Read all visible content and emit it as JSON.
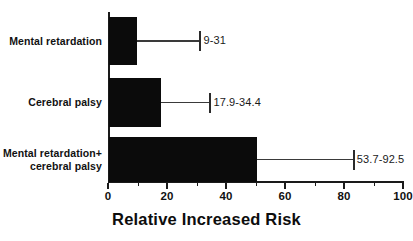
{
  "chart_data": {
    "type": "bar",
    "orientation": "horizontal",
    "title": "",
    "xlabel": "Relative Increased Risk",
    "ylabel": "",
    "xlim": [
      0,
      100
    ],
    "grid": false,
    "legend": null,
    "xticks": [
      0,
      20,
      40,
      60,
      80,
      100
    ],
    "xtick_labels": [
      "0",
      "20",
      "40",
      "60",
      "80",
      "100"
    ],
    "xminor_ticks": [
      10,
      30,
      50,
      70,
      90
    ],
    "bar_color": "#0b0b0b",
    "categories": [
      "Mental retardation",
      "Cerebral palsy",
      "Mental retardation+\ncerebral palsy"
    ],
    "values": [
      9.8,
      18.0,
      50.5
    ],
    "error_bar_upper": [
      31.0,
      34.4,
      83.0
    ],
    "range_labels": [
      "9-31",
      "17.9-34.4",
      "53.7-92.5"
    ],
    "ranges": [
      {
        "low": 9,
        "high": 31
      },
      {
        "low": 17.9,
        "high": 34.4
      },
      {
        "low": 53.7,
        "high": 92.5
      }
    ]
  }
}
